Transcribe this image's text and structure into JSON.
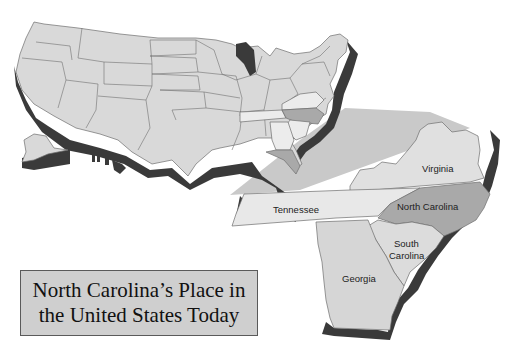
{
  "title": {
    "line1": "North Carolina’s Place in",
    "line2": "the United States Today"
  },
  "labels": {
    "virginia": "Virginia",
    "tennessee": "Tennessee",
    "north_carolina": "North Carolina",
    "south_carolina_1": "South",
    "south_carolina_2": "Carolina",
    "georgia": "Georgia"
  },
  "colors": {
    "us_states": "#d9d9d9",
    "highlight_nc": "#a9a9a9",
    "highlight_neighbors": "#ececec",
    "shadow": "#3a3a3a",
    "callout_wedge": "#c8c8c8",
    "title_box": "#cfcfcf"
  }
}
